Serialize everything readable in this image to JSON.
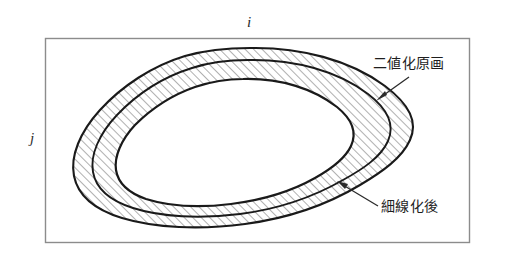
{
  "figure": {
    "name": "binarized-and-thinned-region-diagram",
    "background_color": "#ffffff",
    "frame": {
      "name": "image-frame",
      "stroke_color": "#808080",
      "x": 45,
      "y": 38,
      "width": 425,
      "height": 205
    },
    "axes": {
      "horizontal": {
        "label": "i",
        "position": "top-center"
      },
      "vertical": {
        "label": "j",
        "position": "left-middle"
      }
    },
    "callouts": [
      {
        "id": "binary-original",
        "label": "二値化原画",
        "arrow_from": [
          408,
          78
        ],
        "arrow_to": [
          377,
          100
        ],
        "target": "outer-contour"
      },
      {
        "id": "after-thinning",
        "label": "細線化後",
        "arrow_from": [
          378,
          205
        ],
        "arrow_to": [
          338,
          182
        ],
        "target": "middle-contour"
      }
    ],
    "contours": {
      "outer": {
        "name": "outer-contour",
        "stroke_color": "#1a1a1a",
        "stroke_width": 2.1,
        "fill": "hatched"
      },
      "middle": {
        "name": "middle-contour",
        "stroke_color": "#1a1a1a",
        "stroke_width": 1.9,
        "fill": "hatched"
      },
      "inner": {
        "name": "inner-contour",
        "stroke_color": "#1a1a1a",
        "stroke_width": 2.2,
        "fill": "#ffffff"
      }
    },
    "hatching": {
      "name": "diagonal-hatch-fill",
      "angle_degrees": 45,
      "spacing_px": 6,
      "stroke_color": "#3a3a3a",
      "stroke_width": 0.8
    }
  }
}
